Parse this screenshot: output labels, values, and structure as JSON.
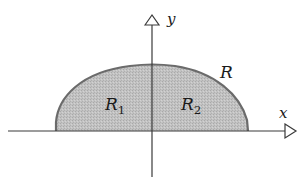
{
  "figure": {
    "type": "region-diagram",
    "axes": {
      "x_label": "x",
      "y_label": "y"
    },
    "region": {
      "name": "R",
      "fill_color": "#bdbdbd",
      "edge_color": "#6b6b6b",
      "subregions": [
        {
          "name": "R",
          "subscript": "1",
          "side": "left of y-axis"
        },
        {
          "name": "R",
          "subscript": "2",
          "side": "right of y-axis"
        }
      ]
    },
    "colors": {
      "axis": "#3a3a3a",
      "text": "#1a1a1a",
      "background": "#ffffff"
    }
  }
}
